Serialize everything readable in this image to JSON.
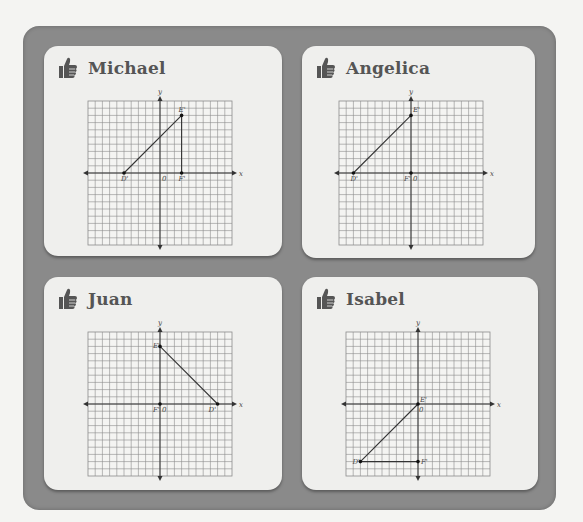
{
  "page": {
    "frame_color": "#8a8a8a",
    "card_color": "#efefed",
    "grid_color": "#8c8c8c",
    "axis_color": "#333333"
  },
  "cards": [
    {
      "name": "Michael",
      "icon": "thumbs-up-icon",
      "graph": {
        "x_label": "x",
        "y_label": "y",
        "origin_label": "0",
        "range": [
          -10,
          10
        ],
        "points": [
          {
            "label": "D'",
            "x": -5,
            "y": 0
          },
          {
            "label": "E'",
            "x": 3,
            "y": 8
          },
          {
            "label": "F'",
            "x": 3,
            "y": 0
          }
        ],
        "segments": [
          [
            "D'",
            "E'"
          ],
          [
            "E'",
            "F'"
          ]
        ]
      }
    },
    {
      "name": "Angelica",
      "icon": "thumbs-up-icon",
      "graph": {
        "x_label": "x",
        "y_label": "y",
        "origin_label": "0",
        "range": [
          -10,
          10
        ],
        "points": [
          {
            "label": "D'",
            "x": -8,
            "y": 0
          },
          {
            "label": "E'",
            "x": 0,
            "y": 8
          },
          {
            "label": "F'",
            "x": 0,
            "y": 0
          }
        ],
        "segments": [
          [
            "D'",
            "E'"
          ]
        ]
      }
    },
    {
      "name": "Juan",
      "icon": "thumbs-up-icon",
      "graph": {
        "x_label": "x",
        "y_label": "y",
        "origin_label": "0",
        "range": [
          -10,
          10
        ],
        "points": [
          {
            "label": "E'",
            "x": 0,
            "y": 8
          },
          {
            "label": "F'",
            "x": 0,
            "y": 0
          },
          {
            "label": "D'",
            "x": 8,
            "y": 0
          }
        ],
        "segments": [
          [
            "E'",
            "D'"
          ]
        ]
      }
    },
    {
      "name": "Isabel",
      "icon": "thumbs-up-icon",
      "graph": {
        "x_label": "x",
        "y_label": "y",
        "origin_label": "0",
        "range": [
          -10,
          10
        ],
        "points": [
          {
            "label": "E'",
            "x": 0,
            "y": 0
          },
          {
            "label": "D'",
            "x": -8,
            "y": -8
          },
          {
            "label": "F'",
            "x": 0,
            "y": -8
          }
        ],
        "segments": [
          [
            "D'",
            "E'"
          ],
          [
            "D'",
            "F'"
          ]
        ]
      }
    }
  ]
}
